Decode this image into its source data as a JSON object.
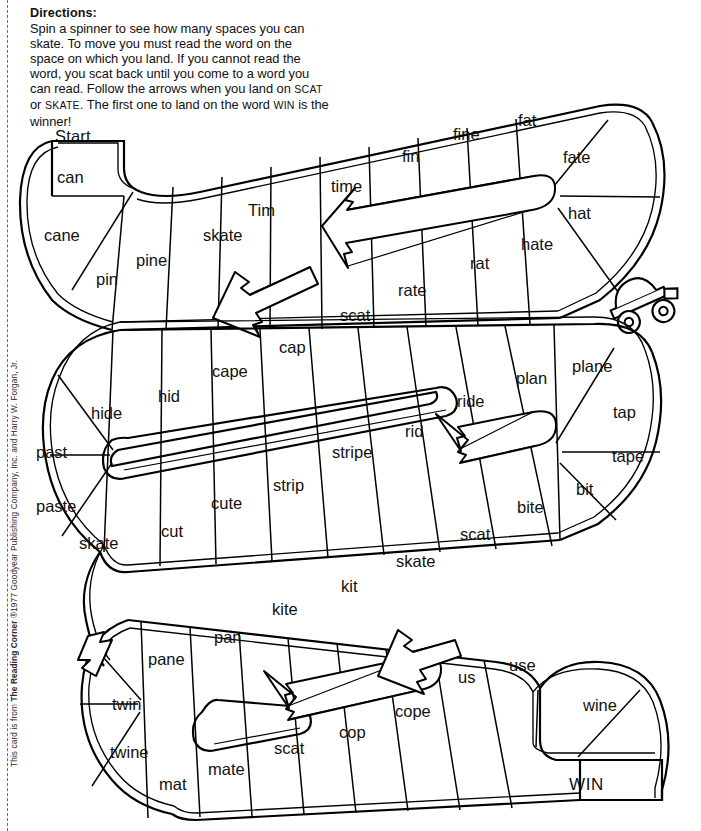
{
  "directions": {
    "title": "Directions:",
    "line1": "Spin a spinner to see how many spaces you can",
    "line2": "skate. To move you must read the word on the",
    "line3": "space on which you land. If you cannot read the",
    "line4": "word, you scat back until you come to a word you",
    "line5a": "can read. Follow the arrows when you land on ",
    "line5b": "SCAT",
    "line6a": "or ",
    "line6b": "SKATE",
    "line6c": ". The first one to land on the word ",
    "line6d": "WIN",
    "line6e": " is the",
    "line7": "winner!"
  },
  "board": {
    "start_label": "Start",
    "finish_label": "WIN",
    "shortcut_words": [
      "SCAT",
      "SKATE"
    ],
    "rows": [
      {
        "id": "row-1",
        "direction": "left-to-right",
        "cells": [
          "can",
          "cane",
          "pin",
          "pine",
          "skate",
          "Tim",
          "time",
          "fin",
          "fine",
          "fat",
          "fate",
          "hat",
          "hate",
          "rat",
          "rate",
          "scat"
        ]
      },
      {
        "id": "row-2",
        "direction": "right-to-left-return",
        "cells": [
          "cap",
          "cape",
          "hid",
          "hide",
          "past",
          "paste",
          "skate",
          "cut",
          "cute",
          "strip",
          "stripe",
          "rid",
          "ride",
          "plan",
          "plane",
          "tap",
          "tape",
          "bit",
          "bite",
          "scat",
          "skate",
          "kit"
        ]
      },
      {
        "id": "row-3",
        "direction": "left-to-right",
        "cells": [
          "kite",
          "pan",
          "pane",
          "twin",
          "twine",
          "mat",
          "mate",
          "scat",
          "cop",
          "cope",
          "us",
          "use",
          "wine",
          "WIN"
        ]
      }
    ],
    "all_words": [
      "can",
      "cane",
      "pin",
      "pine",
      "skate",
      "Tim",
      "time",
      "fin",
      "fine",
      "fat",
      "fate",
      "hat",
      "hate",
      "rat",
      "rate",
      "scat",
      "cap",
      "cape",
      "hid",
      "hide",
      "past",
      "paste",
      "skate",
      "cut",
      "cute",
      "strip",
      "stripe",
      "rid",
      "ride",
      "plan",
      "plane",
      "tap",
      "tape",
      "bit",
      "bite",
      "scat",
      "skate",
      "kit",
      "kite",
      "pan",
      "pane",
      "twin",
      "twine",
      "mat",
      "mate",
      "scat",
      "cop",
      "cope",
      "us",
      "use",
      "wine",
      "WIN"
    ],
    "arrows": [
      {
        "name": "scat-arrow-row1",
        "label": "scat",
        "points": "down-left"
      },
      {
        "name": "skate-arrow-row1",
        "label": "skate",
        "points": "up-left"
      },
      {
        "name": "skate-arrow-row2",
        "label": "skate",
        "points": "up-left"
      },
      {
        "name": "scat-arrow-row2",
        "label": "scat",
        "points": "down-left"
      },
      {
        "name": "skate-arrow-row3",
        "label": "skate",
        "points": "up-left"
      },
      {
        "name": "scat-arrow-row3",
        "label": "scat",
        "points": "down-right"
      }
    ],
    "decoration": "roller-skate-icon"
  },
  "colors": {
    "ink": "#111111",
    "paper": "#ffffff",
    "perforation": "#6b6b6b"
  },
  "footer": {
    "copyright_pre": "This card is from ",
    "copyright_brand": "The Reading Corner",
    "copyright_post": " ®1977 Goodyear Publishing Company, Inc. and Harry W. Forgan, Jr."
  }
}
